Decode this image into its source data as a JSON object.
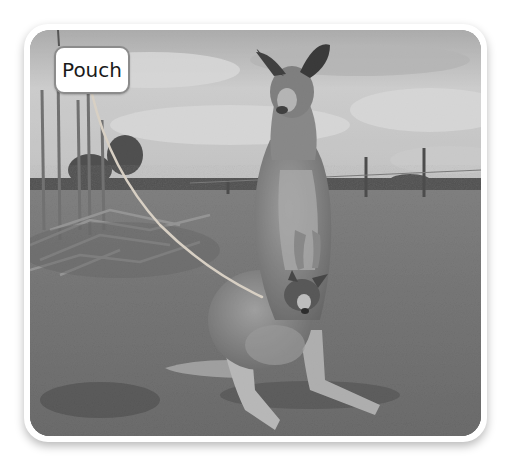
{
  "figure": {
    "callouts": [
      {
        "label": "Pouch",
        "points_to": "joey-in-pouch"
      }
    ]
  },
  "colors": {
    "frame": "#ffffff",
    "label_border": "#8c8c8c",
    "leader_line": "#d8d0c4",
    "label_text": "#1a1a1a"
  }
}
